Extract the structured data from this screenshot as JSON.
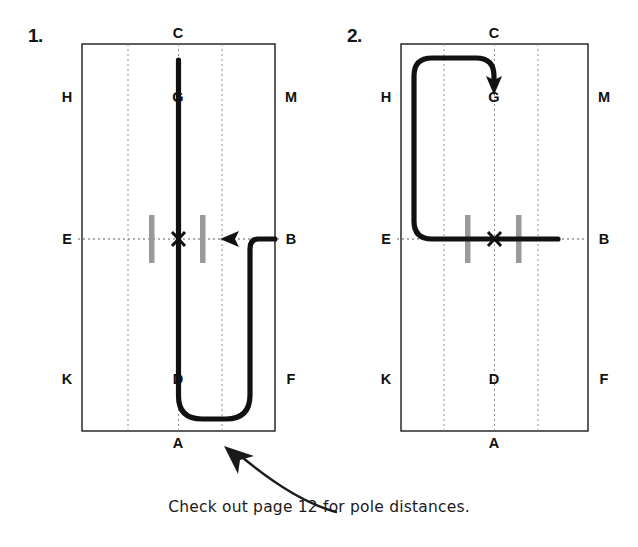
{
  "page": {
    "width": 638,
    "height": 547,
    "background": "#ffffff",
    "caption": "Check out page 12 for pole distances.",
    "caption_arrow_icon": "curved-arrow-up-left-icon"
  },
  "style": {
    "arena_border_color": "#1a1a1a",
    "gridline_color": "#8d8d8d",
    "path_color": "#111111",
    "pole_color": "#9a9a9a",
    "letter_color": "#111111",
    "index_color": "#141414"
  },
  "diagrams": [
    {
      "index_label": "1.",
      "name": "dressage-arena-figure-1",
      "arena": {
        "left": 82,
        "top": 44,
        "right": 275,
        "bottom": 431,
        "center_x": 178.5,
        "mid_y": 239
      },
      "gridlines": {
        "vertical_x": [
          128,
          178.5,
          222
        ],
        "horizontal_y": [
          239
        ]
      },
      "markers": [
        {
          "name": "letter-C",
          "label": "C",
          "x": 178,
          "y": 33
        },
        {
          "name": "letter-H",
          "label": "H",
          "x": 67,
          "y": 97
        },
        {
          "name": "letter-G",
          "label": "G",
          "x": 178,
          "y": 97
        },
        {
          "name": "letter-M",
          "label": "M",
          "x": 291,
          "y": 97
        },
        {
          "name": "letter-E",
          "label": "E",
          "x": 67,
          "y": 239
        },
        {
          "name": "letter-B",
          "label": "B",
          "x": 291,
          "y": 239
        },
        {
          "name": "letter-K",
          "label": "K",
          "x": 67,
          "y": 379
        },
        {
          "name": "letter-D",
          "label": "D",
          "x": 178,
          "y": 379
        },
        {
          "name": "letter-F",
          "label": "F",
          "x": 291,
          "y": 379
        },
        {
          "name": "letter-A",
          "label": "A",
          "x": 178,
          "y": 443
        }
      ],
      "x_marker": {
        "label": "X",
        "x": 178.5,
        "y": 239
      },
      "poles": [
        {
          "name": "pole-left",
          "x": 152,
          "y_top": 215,
          "y_bottom": 263
        },
        {
          "name": "pole-right",
          "x": 203,
          "y_top": 215,
          "y_bottom": 263
        }
      ],
      "path": {
        "name": "ridden-track-path-1",
        "description": "From B turn right onto centre line, down past X and D, around bottom, finishing up the centre line past G toward C",
        "d": "M 275 239 L 258 239 Q 250 239 250 249 L 250 395 Q 250 419 226 419 L 202 419 Q 178.5 419 178.5 396 L 178.5 60",
        "arrowhead": {
          "name": "arrowhead-at-x",
          "x": 222,
          "y": 239,
          "direction": "left"
        }
      }
    },
    {
      "index_label": "2.",
      "name": "dressage-arena-figure-2",
      "arena": {
        "left": 401,
        "top": 44,
        "right": 588,
        "bottom": 431,
        "center_x": 494.5,
        "mid_y": 239
      },
      "gridlines": {
        "vertical_x": [
          444,
          494.5,
          538
        ],
        "horizontal_y": [
          239
        ]
      },
      "markers": [
        {
          "name": "letter-C",
          "label": "C",
          "x": 494,
          "y": 33
        },
        {
          "name": "letter-H",
          "label": "H",
          "x": 386,
          "y": 97
        },
        {
          "name": "letter-G",
          "label": "G",
          "x": 494,
          "y": 97
        },
        {
          "name": "letter-M",
          "label": "M",
          "x": 604,
          "y": 97
        },
        {
          "name": "letter-E",
          "label": "E",
          "x": 386,
          "y": 239
        },
        {
          "name": "letter-B",
          "label": "B",
          "x": 604,
          "y": 239
        },
        {
          "name": "letter-K",
          "label": "K",
          "x": 386,
          "y": 379
        },
        {
          "name": "letter-D",
          "label": "D",
          "x": 494,
          "y": 379
        },
        {
          "name": "letter-F",
          "label": "F",
          "x": 604,
          "y": 379
        },
        {
          "name": "letter-A",
          "label": "A",
          "x": 494,
          "y": 443
        }
      ],
      "x_marker": {
        "label": "X",
        "x": 494.5,
        "y": 239
      },
      "poles": [
        {
          "name": "pole-left",
          "x": 468,
          "y_top": 215,
          "y_bottom": 263
        },
        {
          "name": "pole-right",
          "x": 519,
          "y_top": 215,
          "y_bottom": 263
        }
      ],
      "path": {
        "name": "ridden-track-path-2",
        "description": "From B along the E-B line through X, turn right up the long side, loop across the top and finish pointing down at G",
        "d": "M 558 239 L 432 239 Q 414 239 414 221 L 414 76 Q 414 58 432 58 L 476 58 Q 494 58 494 76 L 494 83",
        "arrowhead": {
          "name": "arrowhead-at-g",
          "x": 494,
          "y": 93,
          "direction": "down"
        }
      }
    }
  ]
}
